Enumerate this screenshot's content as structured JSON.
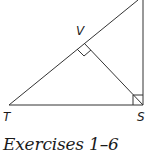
{
  "diagram": {
    "type": "right-triangle-with-altitude",
    "points": {
      "T": {
        "label": "T"
      },
      "S": {
        "label": "S"
      },
      "V": {
        "label": "V"
      }
    },
    "right_angle_markers": [
      "V",
      "S"
    ],
    "line_color": "#333333"
  },
  "caption": {
    "text": "Exercises 1–6"
  }
}
